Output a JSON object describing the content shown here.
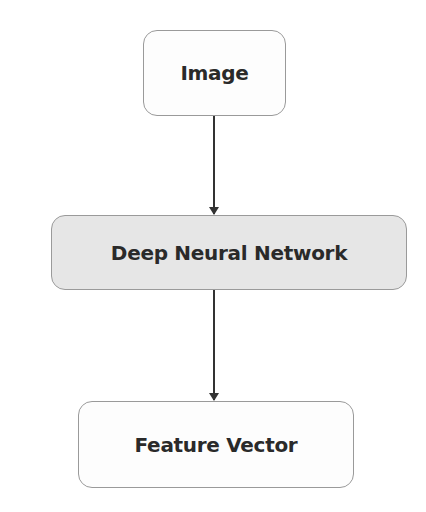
{
  "diagram": {
    "type": "flowchart",
    "direction": "top-to-bottom",
    "nodes": [
      {
        "id": "image",
        "label": "Image",
        "fill": "#fdfdfd"
      },
      {
        "id": "dnn",
        "label": "Deep Neural Network",
        "fill": "#e6e6e6"
      },
      {
        "id": "feature_vector",
        "label": "Feature Vector",
        "fill": "#fdfdfd"
      }
    ],
    "edges": [
      {
        "from": "image",
        "to": "dnn"
      },
      {
        "from": "dnn",
        "to": "feature_vector"
      }
    ],
    "colors": {
      "border": "#9a9a9a",
      "text": "#2a2a2a",
      "arrow": "#333333"
    }
  }
}
